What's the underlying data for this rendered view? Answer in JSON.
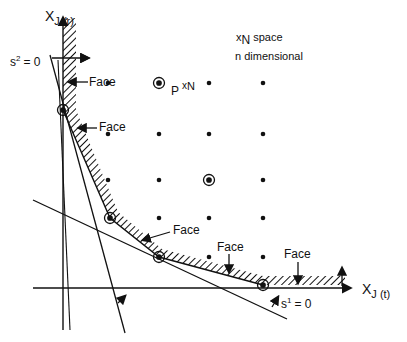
{
  "diagram": {
    "axes": {
      "vertical_label_main": "X",
      "vertical_label_sub": "J (r)",
      "horizontal_label_main": "X",
      "horizontal_label_sub": "J (t)"
    },
    "space_label": {
      "line1_prefix": "x",
      "line1_sub": "N",
      "line1_suffix": "space",
      "line2": "n dimensional"
    },
    "polytope_label": {
      "main": "P",
      "sup_x": "x",
      "sup_n": "N"
    },
    "constraint_labels": {
      "s2": "s",
      "s2_sup": "2",
      "s2_eq": "= 0",
      "s1": "s",
      "s1_sup": "1",
      "s1_eq": "= 0"
    },
    "face_labels": [
      "Face",
      "Face",
      "Face",
      "Face",
      "Face"
    ],
    "grid_points": [
      {
        "x": 108,
        "y": 83
      },
      {
        "x": 159,
        "y": 83,
        "circled": true
      },
      {
        "x": 209,
        "y": 83
      },
      {
        "x": 263,
        "y": 83
      },
      {
        "x": 108,
        "y": 134
      },
      {
        "x": 159,
        "y": 134
      },
      {
        "x": 209,
        "y": 134
      },
      {
        "x": 263,
        "y": 134
      },
      {
        "x": 108,
        "y": 180
      },
      {
        "x": 159,
        "y": 180
      },
      {
        "x": 209,
        "y": 180,
        "circled": true
      },
      {
        "x": 263,
        "y": 180
      },
      {
        "x": 110,
        "y": 218,
        "circled": true
      },
      {
        "x": 159,
        "y": 218
      },
      {
        "x": 209,
        "y": 218
      },
      {
        "x": 263,
        "y": 218
      },
      {
        "x": 159,
        "y": 257,
        "circled": true
      },
      {
        "x": 209,
        "y": 257
      },
      {
        "x": 263,
        "y": 257
      },
      {
        "x": 63,
        "y": 110,
        "circled": true
      },
      {
        "x": 263,
        "y": 285,
        "circled": true
      }
    ],
    "colors": {
      "ink": "#111111",
      "background": "#ffffff"
    }
  }
}
